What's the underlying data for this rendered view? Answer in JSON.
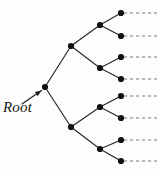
{
  "figure": {
    "type": "binary-tree-diagram",
    "background_color": "#fdfdfd",
    "edge_color": "#262626",
    "node_color": "#111111",
    "dash_color": "#7d7d7d",
    "arrow_color": "#1f1f1f",
    "node_radius": 3.1,
    "edge_width": 1.15
  },
  "label": {
    "root_text": "Root",
    "style": "italic-serif"
  },
  "arrow": {
    "name": "root-pointer-arrow",
    "from_x": 22,
    "from_y": 104,
    "to_x": 41.5,
    "to_y": 90.5
  },
  "nodes": [
    {
      "id": "root",
      "name": "root-node",
      "depth": 0,
      "x": 45,
      "y": 87
    },
    {
      "id": "n-u1",
      "name": "internal-node-u1",
      "depth": 1,
      "x": 71,
      "y": 46
    },
    {
      "id": "n-l1",
      "name": "internal-node-l1",
      "depth": 1,
      "x": 71,
      "y": 127
    },
    {
      "id": "n-u2a",
      "name": "internal-node-u2a",
      "depth": 2,
      "x": 100,
      "y": 25
    },
    {
      "id": "n-u2b",
      "name": "internal-node-u2b",
      "depth": 2,
      "x": 100,
      "y": 68
    },
    {
      "id": "n-l2a",
      "name": "internal-node-l2a",
      "depth": 2,
      "x": 100,
      "y": 107
    },
    {
      "id": "n-l2b",
      "name": "internal-node-l2b",
      "depth": 2,
      "x": 100,
      "y": 149
    },
    {
      "id": "leaf1",
      "name": "leaf-node-1",
      "depth": 3,
      "x": 121,
      "y": 13
    },
    {
      "id": "leaf2",
      "name": "leaf-node-2",
      "depth": 3,
      "x": 121,
      "y": 36
    },
    {
      "id": "leaf3",
      "name": "leaf-node-3",
      "depth": 3,
      "x": 121,
      "y": 57
    },
    {
      "id": "leaf4",
      "name": "leaf-node-4",
      "depth": 3,
      "x": 121,
      "y": 79
    },
    {
      "id": "leaf5",
      "name": "leaf-node-5",
      "depth": 3,
      "x": 121,
      "y": 96
    },
    {
      "id": "leaf6",
      "name": "leaf-node-6",
      "depth": 3,
      "x": 121,
      "y": 118
    },
    {
      "id": "leaf7",
      "name": "leaf-node-7",
      "depth": 3,
      "x": 121,
      "y": 140
    },
    {
      "id": "leaf8",
      "name": "leaf-node-8",
      "depth": 3,
      "x": 121,
      "y": 161
    }
  ],
  "edges": [
    {
      "name": "edge-root-u1",
      "x1": 45,
      "y1": 87,
      "x2": 71,
      "y2": 46
    },
    {
      "name": "edge-root-l1",
      "x1": 45,
      "y1": 87,
      "x2": 71,
      "y2": 127
    },
    {
      "name": "edge-u1-u2a",
      "x1": 71,
      "y1": 46,
      "x2": 100,
      "y2": 25
    },
    {
      "name": "edge-u1-u2b",
      "x1": 71,
      "y1": 46,
      "x2": 100,
      "y2": 68
    },
    {
      "name": "edge-l1-l2a",
      "x1": 71,
      "y1": 127,
      "x2": 100,
      "y2": 107
    },
    {
      "name": "edge-l1-l2b",
      "x1": 71,
      "y1": 127,
      "x2": 100,
      "y2": 149
    },
    {
      "name": "edge-u2a-leaf1",
      "x1": 100,
      "y1": 25,
      "x2": 121,
      "y2": 13
    },
    {
      "name": "edge-u2a-leaf2",
      "x1": 100,
      "y1": 25,
      "x2": 121,
      "y2": 36
    },
    {
      "name": "edge-u2b-leaf3",
      "x1": 100,
      "y1": 68,
      "x2": 121,
      "y2": 57
    },
    {
      "name": "edge-u2b-leaf4",
      "x1": 100,
      "y1": 68,
      "x2": 121,
      "y2": 79
    },
    {
      "name": "edge-l2a-leaf5",
      "x1": 100,
      "y1": 107,
      "x2": 121,
      "y2": 96
    },
    {
      "name": "edge-l2a-leaf6",
      "x1": 100,
      "y1": 107,
      "x2": 121,
      "y2": 118
    },
    {
      "name": "edge-l2b-leaf7",
      "x1": 100,
      "y1": 149,
      "x2": 121,
      "y2": 140
    },
    {
      "name": "edge-l2b-leaf8",
      "x1": 100,
      "y1": 149,
      "x2": 121,
      "y2": 161
    }
  ],
  "dashed_continuations": [
    {
      "name": "dashed-line-1",
      "x1": 124,
      "y1": 13,
      "x2": 157
    },
    {
      "name": "dashed-line-2",
      "x1": 124,
      "y1": 36,
      "x2": 157
    },
    {
      "name": "dashed-line-3",
      "x1": 124,
      "y1": 57,
      "x2": 157
    },
    {
      "name": "dashed-line-4",
      "x1": 124,
      "y1": 79,
      "x2": 157
    },
    {
      "name": "dashed-line-5",
      "x1": 124,
      "y1": 96,
      "x2": 157
    },
    {
      "name": "dashed-line-6",
      "x1": 124,
      "y1": 118,
      "x2": 157
    },
    {
      "name": "dashed-line-7",
      "x1": 124,
      "y1": 140,
      "x2": 157
    },
    {
      "name": "dashed-line-8",
      "x1": 124,
      "y1": 161,
      "x2": 157
    }
  ]
}
